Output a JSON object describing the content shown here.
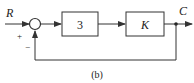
{
  "diagram": {
    "type": "block-diagram",
    "caption": "(b)",
    "input_label": "R",
    "output_label": "C",
    "summing_junction": {
      "plus_sign": "+",
      "minus_sign": "−"
    },
    "blocks": [
      {
        "id": "block1",
        "label": "3"
      },
      {
        "id": "block2",
        "label": "K"
      }
    ],
    "feedback": "unity negative feedback from C to summing junction",
    "colors": {
      "line": "#333333",
      "background": "#ffffff"
    }
  }
}
